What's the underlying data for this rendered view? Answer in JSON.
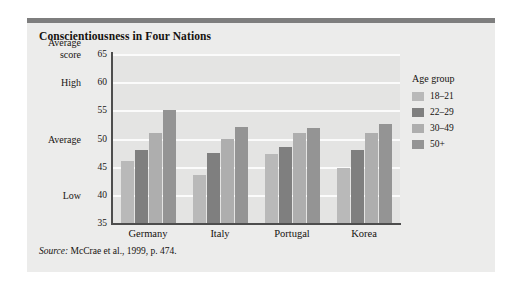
{
  "figure": {
    "title": "Conscientiousness in Four Nations",
    "source_keyword": "Source:",
    "source_text": " McCrae et al., 1999, p. 474."
  },
  "legend": {
    "title": "Age group",
    "position": "right"
  },
  "axis": {
    "y_title_line1": "Average",
    "y_title_line2": "score",
    "anchors": [
      {
        "label": "High",
        "value": 60
      },
      {
        "label": "Average",
        "value": 50
      },
      {
        "label": "Low",
        "value": 40
      }
    ]
  },
  "colors": {
    "panel_background": "#ececeb",
    "plot_background": "#e4e4e3",
    "accent_bar": "#7e7e7e",
    "gridline": "#fbfbfb",
    "axis_line": "#4d4d4d",
    "series": [
      "#b9b9b9",
      "#7f7f7f",
      "#aeaeae",
      "#949494"
    ]
  },
  "chart_data": {
    "type": "bar",
    "title": "Conscientiousness in Four Nations",
    "xlabel": "",
    "ylabel": "Average score",
    "ylim": [
      35,
      65
    ],
    "yticks": [
      35,
      40,
      45,
      50,
      55,
      60,
      65
    ],
    "grid": true,
    "legend_title": "Age group",
    "categories": [
      "Germany",
      "Italy",
      "Portugal",
      "Korea"
    ],
    "series": [
      {
        "name": "18–21",
        "values": [
          46.0,
          43.5,
          47.3,
          44.7
        ]
      },
      {
        "name": "22–29",
        "values": [
          48.0,
          47.5,
          48.5,
          48.0
        ]
      },
      {
        "name": "30–49",
        "values": [
          51.0,
          50.0,
          51.0,
          51.0
        ]
      },
      {
        "name": "50+",
        "values": [
          55.0,
          52.0,
          51.8,
          52.5
        ]
      }
    ],
    "source": "Source: McCrae et al., 1999, p. 474."
  }
}
